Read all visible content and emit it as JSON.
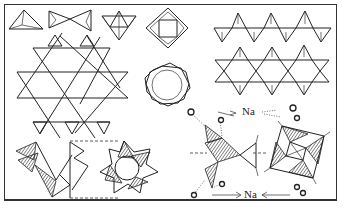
{
  "figure": {
    "type": "silicate tetrahedra structure diagram",
    "panels": [
      {
        "id": "single-tetrahedron",
        "shape": "triangle"
      },
      {
        "id": "double-tetrahedron",
        "shape": "bowtie"
      },
      {
        "id": "three-ring",
        "shape": "triangle-ring"
      },
      {
        "id": "four-ring",
        "shape": "square-ring"
      },
      {
        "id": "single-chain",
        "shape": "zigzag-chain"
      },
      {
        "id": "double-chain",
        "shape": "band"
      },
      {
        "id": "sheet",
        "shape": "hexagonal-sheet"
      },
      {
        "id": "six-ring",
        "shape": "hexagon-ring"
      },
      {
        "id": "framework-side",
        "shape": "hatched-tetrahedra"
      },
      {
        "id": "framework-top",
        "shape": "eight-point-star"
      },
      {
        "id": "sodalite-cage-side",
        "shape": "hatched-tetrahedra-with-na"
      },
      {
        "id": "sodalite-cage-top",
        "shape": "hatched-square"
      }
    ],
    "labels": {
      "na_top": "Na",
      "na_bottom": "Na"
    },
    "colors": {
      "line": "#222222",
      "background": "#ffffff"
    }
  }
}
